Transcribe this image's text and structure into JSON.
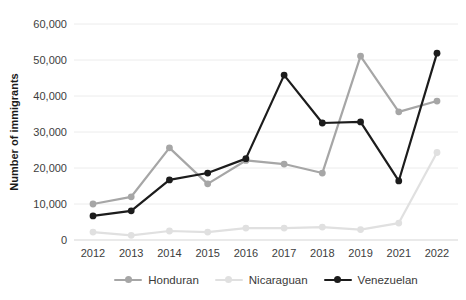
{
  "chart_data": {
    "type": "line",
    "title": "",
    "xlabel": "",
    "ylabel": "Number of immigrants",
    "ylim": [
      0,
      60000
    ],
    "ytick_labels": [
      "0",
      "10,000",
      "20,000",
      "30,000",
      "40,000",
      "50,000",
      "60,000"
    ],
    "grid": "horizontal-light",
    "legend_position": "bottom-center",
    "categories": [
      "2012",
      "2013",
      "2014",
      "2015",
      "2016",
      "2017",
      "2018",
      "2019",
      "2021",
      "2022"
    ],
    "series": [
      {
        "name": "Honduran",
        "color": "#a6a6a6",
        "values": [
          10000,
          12000,
          25600,
          15600,
          22100,
          21100,
          18600,
          51100,
          35600,
          38600
        ]
      },
      {
        "name": "Nicaraguan",
        "color": "#e0e0e0",
        "values": [
          2200,
          1300,
          2500,
          2200,
          3300,
          3300,
          3600,
          2900,
          4700,
          24300
        ]
      },
      {
        "name": "Venezuelan",
        "color": "#1c1c1c",
        "values": [
          6700,
          8100,
          16700,
          18600,
          22600,
          45800,
          32500,
          32800,
          16400,
          51900
        ]
      }
    ],
    "colors": {
      "gridline": "#ececec",
      "axis_line": "#d6d6d6",
      "tick_text": "#3d3d3d"
    }
  }
}
